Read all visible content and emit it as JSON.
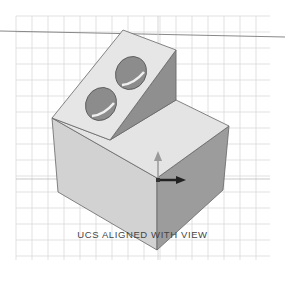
{
  "viewport": {
    "caption": "UCS ALIGNED WITH VIEW",
    "grid": {
      "x0": 16,
      "y0": 16,
      "x1": 270,
      "y1": 260,
      "spacing": 16,
      "color": "#d9d9d9"
    },
    "colors": {
      "background": "#ffffff",
      "top_face": "#e2e2e2",
      "front_face": "#d0d0d0",
      "right_face": "#9a9a9a",
      "hole": "#8a8a8a",
      "edge": "#555555",
      "axis_line": "#888888"
    },
    "ucs_icon": {
      "y_label": "Y",
      "x_label": "X"
    }
  }
}
